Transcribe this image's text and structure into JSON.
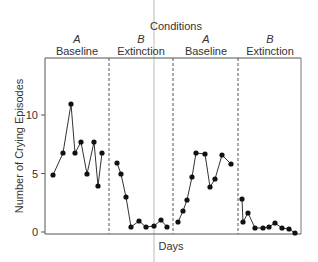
{
  "chart_data": {
    "type": "line",
    "title": "Conditions",
    "xlabel": "Days",
    "ylabel": "Number of Crying Episodes",
    "ylim": [
      0,
      14
    ],
    "yticks": [
      0,
      5,
      10
    ],
    "grid": false,
    "legend": null,
    "phases": [
      {
        "letter": "A",
        "name": "Baseline"
      },
      {
        "letter": "B",
        "name": "Extinction"
      },
      {
        "letter": "A",
        "name": "Baseline"
      },
      {
        "letter": "B",
        "name": "Extinction"
      }
    ],
    "phase_dividers": "dashed vertical lines between phases",
    "series": [
      {
        "name": "A Baseline",
        "x": [
          1,
          2,
          3,
          4,
          5,
          6,
          7,
          8,
          9
        ],
        "values": [
          5,
          7,
          11,
          7,
          8,
          5,
          8,
          4,
          7
        ]
      },
      {
        "name": "B Extinction",
        "x": [
          10,
          11,
          12,
          13,
          14,
          15,
          16,
          17,
          18
        ],
        "values": [
          6,
          5,
          3,
          0.5,
          1,
          0.5,
          0.5,
          1,
          0.5
        ]
      },
      {
        "name": "A Baseline",
        "x": [
          19,
          20,
          21,
          22,
          23,
          24,
          25,
          26,
          27,
          28
        ],
        "values": [
          1,
          2,
          3,
          5,
          7,
          7,
          4,
          4.5,
          6.5,
          6
        ]
      },
      {
        "name": "B Extinction",
        "x": [
          29,
          30,
          31,
          32,
          33,
          34,
          35,
          36,
          37,
          38
        ],
        "values": [
          3,
          1,
          1.5,
          0.3,
          0.3,
          0.4,
          0.8,
          0.3,
          0.3,
          0
        ]
      }
    ]
  },
  "plot": {
    "px_points": [
      [
        [
          53,
          175
        ],
        [
          63,
          153
        ],
        [
          71,
          104
        ],
        [
          75,
          153
        ],
        [
          81,
          142
        ],
        [
          87,
          174
        ],
        [
          94,
          142
        ],
        [
          98,
          186
        ],
        [
          102,
          153
        ]
      ],
      [
        [
          117,
          163
        ],
        [
          121,
          174
        ],
        [
          126,
          197
        ],
        [
          131,
          227
        ],
        [
          139,
          221
        ],
        [
          146,
          227
        ],
        [
          154,
          226
        ],
        [
          161,
          220
        ],
        [
          167,
          227
        ]
      ],
      [
        [
          178,
          222
        ],
        [
          183,
          211
        ],
        [
          187,
          200
        ],
        [
          192,
          177
        ],
        [
          196,
          153
        ],
        [
          205,
          154
        ],
        [
          210,
          187
        ],
        [
          215,
          179
        ],
        [
          222,
          155
        ],
        [
          231,
          164
        ]
      ],
      [
        [
          242,
          199
        ],
        [
          243,
          222
        ],
        [
          248,
          213
        ],
        [
          255,
          228
        ],
        [
          263,
          228
        ],
        [
          269,
          227
        ],
        [
          275,
          223
        ],
        [
          282,
          228
        ],
        [
          289,
          229
        ],
        [
          295,
          233
        ]
      ]
    ],
    "dividers_x": [
      109,
      173,
      238
    ],
    "label_centers_x": [
      77,
      141,
      206,
      270
    ]
  }
}
